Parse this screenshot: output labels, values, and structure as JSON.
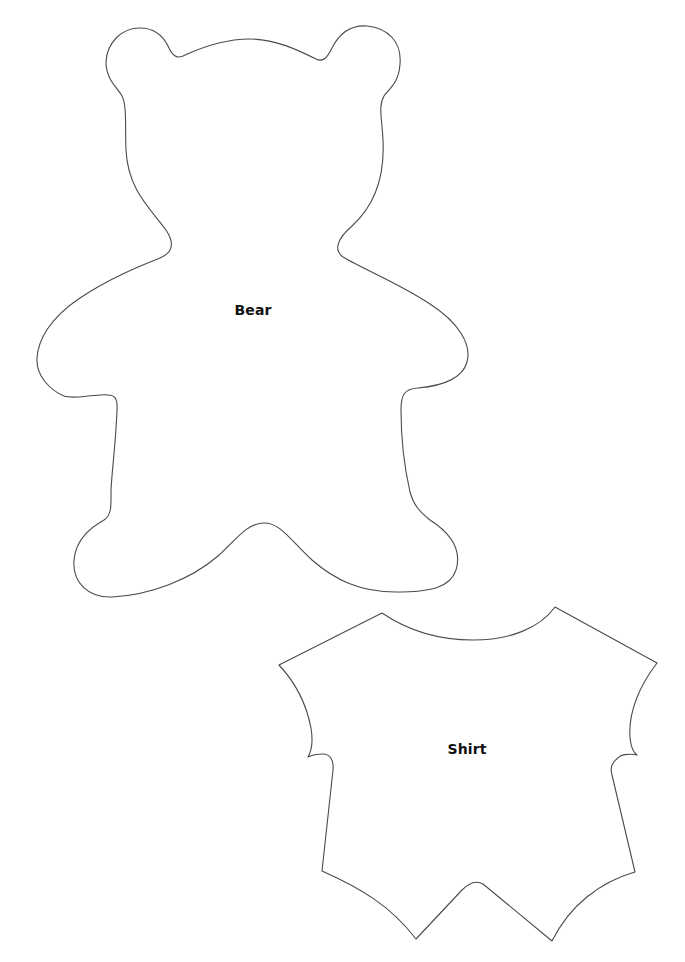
{
  "page": {
    "background": "#ffffff",
    "stroke_color": "#4a4a4a"
  },
  "shapes": [
    {
      "id": "bear",
      "label": "Bear",
      "label_position": {
        "x": 253,
        "y": 310
      }
    },
    {
      "id": "shirt",
      "label": "Shirt",
      "label_position": {
        "x": 467,
        "y": 749
      }
    }
  ]
}
